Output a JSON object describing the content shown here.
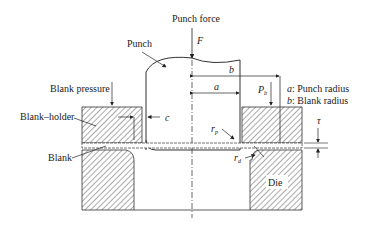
{
  "diagram": {
    "labels": {
      "punch_force": "Punch force",
      "force_symbol": "F",
      "punch": "Punch",
      "blank_pressure": "Blank pressure",
      "blank_holder": "Blank–holder",
      "blank": "Blank",
      "clearance": "c",
      "punch_radius_sym": "a",
      "blank_radius_sym": "b",
      "holder_pressure_sym": "P",
      "holder_pressure_sub": "b",
      "punch_corner_radius_sym": "r",
      "punch_corner_radius_sub": "p",
      "die_corner_radius_sym": "r",
      "die_corner_radius_sub": "d",
      "thickness_sym": "τ",
      "die": "Die"
    },
    "legend": [
      {
        "symbol": "a",
        "text": ": Punch radius"
      },
      {
        "symbol": "b",
        "text": ": Blank radius"
      }
    ],
    "colors": {
      "line": "#333333",
      "hatch": "#555555",
      "background": "#ffffff"
    }
  }
}
